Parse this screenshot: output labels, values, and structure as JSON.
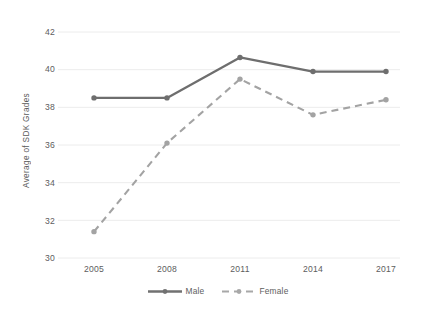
{
  "chart_data": {
    "type": "line",
    "title": "",
    "subtitle": "",
    "xlabel": "",
    "ylabel": "Average of SDK Grades",
    "categories": [
      "2005",
      "2008",
      "2011",
      "2014",
      "2017"
    ],
    "x": [
      2005,
      2008,
      2011,
      2014,
      2017
    ],
    "series": [
      {
        "name": "Male",
        "values": [
          38.5,
          38.5,
          40.65,
          39.9,
          39.9
        ],
        "style": "solid",
        "color": "#6e6e6e",
        "marker": "circle"
      },
      {
        "name": "Female",
        "values": [
          31.4,
          36.1,
          39.5,
          37.6,
          38.4
        ],
        "style": "dashed",
        "color": "#a3a3a3",
        "marker": "circle"
      }
    ],
    "ylim": [
      30,
      42
    ],
    "yticks": [
      "30",
      "32",
      "34",
      "36",
      "38",
      "40",
      "42"
    ],
    "xticks": [
      "2005",
      "2008",
      "2011",
      "2014",
      "2017"
    ],
    "grid": "horizontal",
    "legend_position": "bottom",
    "legend": [
      "Male",
      "Female"
    ],
    "colors": {
      "male_line": "#6e6e6e",
      "female_line": "#a3a3a3",
      "gridline": "#e8e8e8",
      "tick_text": "#5d5d5d",
      "background": "#ffffff"
    }
  },
  "axis": {
    "y_title": "Average of SDK Grades",
    "y_ticks": [
      {
        "label": "42",
        "value": 42
      },
      {
        "label": "40",
        "value": 40
      },
      {
        "label": "38",
        "value": 38
      },
      {
        "label": "36",
        "value": 36
      },
      {
        "label": "34",
        "value": 34
      },
      {
        "label": "32",
        "value": 32
      },
      {
        "label": "30",
        "value": 30
      }
    ],
    "x_ticks": [
      {
        "label": "2005"
      },
      {
        "label": "2008"
      },
      {
        "label": "2011"
      },
      {
        "label": "2014"
      },
      {
        "label": "2017"
      }
    ]
  },
  "legend": {
    "items": [
      {
        "label": "Male",
        "style": "solid"
      },
      {
        "label": "Female",
        "style": "dashed"
      }
    ]
  }
}
